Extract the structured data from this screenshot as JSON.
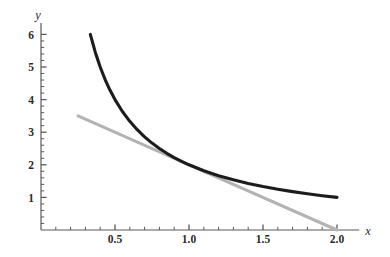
{
  "chart_data": {
    "type": "line",
    "title": "",
    "subtitle": "",
    "xlabel": "x",
    "ylabel": "y",
    "xlim": [
      0,
      2.15
    ],
    "ylim": [
      0,
      6.35
    ],
    "grid": false,
    "legend": null,
    "background_color": "#ffffff",
    "axis_color": "#5a5a5a",
    "x_ticks": [
      {
        "value": 0.5,
        "label": "0.5"
      },
      {
        "value": 1.0,
        "label": "1.0"
      },
      {
        "value": 1.5,
        "label": "1.5"
      },
      {
        "value": 2.0,
        "label": "2.0"
      }
    ],
    "y_ticks": [
      {
        "value": 1,
        "label": "1"
      },
      {
        "value": 2,
        "label": "2"
      },
      {
        "value": 3,
        "label": "3"
      },
      {
        "value": 4,
        "label": "4"
      },
      {
        "value": 5,
        "label": "5"
      },
      {
        "value": 6,
        "label": "6"
      }
    ],
    "x_minor_step": 0.1,
    "y_minor_step": 0.2,
    "series": [
      {
        "name": "curve",
        "expression": "y = 2/x",
        "color": "#1c1c1c",
        "width": 3.1,
        "x_start": 0.3333,
        "x_end": 2.0,
        "points": [
          {
            "x": 0.3333,
            "y": 6.0
          },
          {
            "x": 0.3667,
            "y": 5.4545
          },
          {
            "x": 0.4,
            "y": 5.0
          },
          {
            "x": 0.4333,
            "y": 4.6154
          },
          {
            "x": 0.4667,
            "y": 4.2857
          },
          {
            "x": 0.5,
            "y": 4.0
          },
          {
            "x": 0.55,
            "y": 3.6364
          },
          {
            "x": 0.6,
            "y": 3.3333
          },
          {
            "x": 0.65,
            "y": 3.0769
          },
          {
            "x": 0.7,
            "y": 2.8571
          },
          {
            "x": 0.75,
            "y": 2.6667
          },
          {
            "x": 0.8,
            "y": 2.5
          },
          {
            "x": 0.85,
            "y": 2.3529
          },
          {
            "x": 0.9,
            "y": 2.2222
          },
          {
            "x": 0.95,
            "y": 2.1053
          },
          {
            "x": 1.0,
            "y": 2.0
          },
          {
            "x": 1.1,
            "y": 1.8182
          },
          {
            "x": 1.2,
            "y": 1.6667
          },
          {
            "x": 1.3,
            "y": 1.5385
          },
          {
            "x": 1.4,
            "y": 1.4286
          },
          {
            "x": 1.5,
            "y": 1.3333
          },
          {
            "x": 1.6,
            "y": 1.25
          },
          {
            "x": 1.7,
            "y": 1.1765
          },
          {
            "x": 1.8,
            "y": 1.1111
          },
          {
            "x": 1.9,
            "y": 1.0526
          },
          {
            "x": 2.0,
            "y": 1.0
          }
        ]
      },
      {
        "name": "tangent-line",
        "expression": "y = 4 - 2x",
        "color": "#b3b3b3",
        "width": 3.1,
        "x_start": 0.25,
        "x_end": 2.0,
        "points": [
          {
            "x": 0.25,
            "y": 3.5
          },
          {
            "x": 1.0,
            "y": 2.0
          },
          {
            "x": 2.0,
            "y": 0.0
          }
        ]
      }
    ],
    "annotations": [
      {
        "name": "tangency-point",
        "x": 1.0,
        "y": 2.0
      }
    ]
  }
}
